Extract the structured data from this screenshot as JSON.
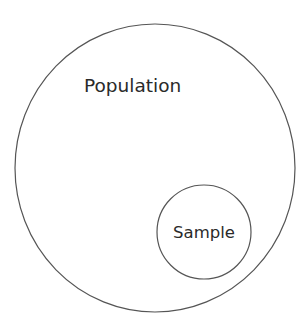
{
  "diagram": {
    "type": "nested-circles",
    "outer": {
      "label": "Population",
      "stroke": "#555555"
    },
    "inner": {
      "label": "Sample",
      "stroke": "#555555"
    }
  }
}
